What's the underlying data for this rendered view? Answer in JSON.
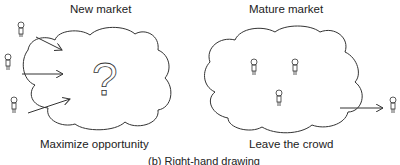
{
  "left_panel": {
    "title": "New market",
    "subtitle": "Maximize opportunity",
    "symbol": "?",
    "icons": [
      "person-icon",
      "person-icon",
      "person-icon"
    ]
  },
  "right_panel": {
    "title": "Mature market",
    "subtitle": "Leave the crowd",
    "icons": [
      "person-icon",
      "person-icon",
      "person-icon",
      "person-icon"
    ]
  },
  "caption": "(b)  Right-hand drawing"
}
